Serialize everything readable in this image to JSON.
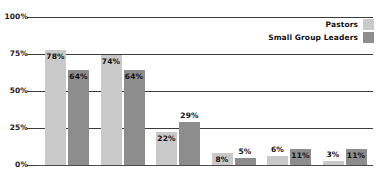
{
  "chart_data": {
    "type": "bar",
    "title": "",
    "subtitle": "",
    "xlabel": "",
    "ylabel": "",
    "ylim": [
      0,
      100
    ],
    "yticks": [
      "0%",
      "25%",
      "50%",
      "75%",
      "100%"
    ],
    "grid": true,
    "legend_position": "top-right",
    "categories": [
      "Fellowship",
      "Discipleship",
      "Assimilation",
      "Evangelism",
      "Ministry",
      "Worship"
    ],
    "series": [
      {
        "name": "Pastors",
        "color": "#c9c9c9",
        "values": [
          78,
          74,
          22,
          8,
          6,
          3
        ],
        "labels": [
          "78%",
          "74%",
          "22%",
          "8%",
          "6%",
          "3%"
        ],
        "label_positions": [
          "inside",
          "inside",
          "inside",
          "inside",
          "above",
          "above"
        ]
      },
      {
        "name": "Small Group Leaders",
        "color": "#8d8d8d",
        "values": [
          64,
          64,
          29,
          5,
          11,
          11
        ],
        "labels": [
          "64%",
          "64%",
          "29%",
          "5%",
          "11%",
          "11%"
        ],
        "label_positions": [
          "inside",
          "inside",
          "above",
          "above",
          "inside",
          "inside"
        ]
      }
    ]
  },
  "legend": {
    "items": [
      {
        "label": "Pastors",
        "color": "#c9c9c9"
      },
      {
        "label": "Small Group Leaders",
        "color": "#8d8d8d"
      }
    ]
  },
  "axis": {
    "y_labels": [
      "100%",
      "75%",
      "50%",
      "25%",
      "0%"
    ]
  }
}
